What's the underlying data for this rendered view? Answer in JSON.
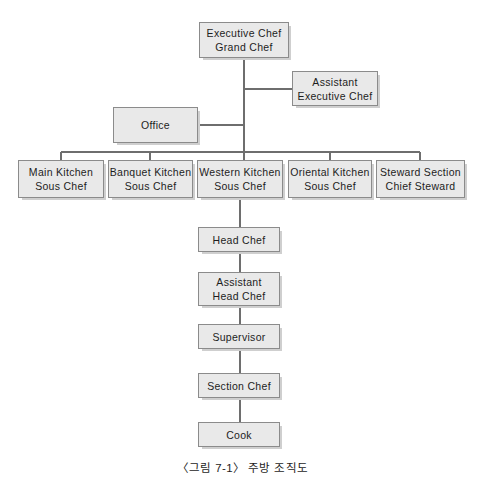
{
  "diagram": {
    "title_caption": "〈그림 7-1〉 주방 조직도",
    "colors": {
      "box_fill": "#e9e9e9",
      "box_border": "#8b8b8b",
      "box_shadow": "#cfcfcf",
      "connector": "#6e6e6e",
      "text": "#1d1d1d",
      "background": "#ffffff"
    },
    "nodes": [
      {
        "id": "executive-chef",
        "line1": "Executive Chef",
        "line2": "Grand Chef",
        "x": 199,
        "y": 22,
        "w": 90,
        "h": 36
      },
      {
        "id": "assistant-executive-chef",
        "line1": "Assistant",
        "line2": "Executive Chef",
        "x": 292,
        "y": 71,
        "w": 86,
        "h": 35
      },
      {
        "id": "office",
        "line1": "Office",
        "line2": "",
        "x": 113,
        "y": 107,
        "w": 85,
        "h": 36
      },
      {
        "id": "main-kitchen",
        "line1": "Main Kitchen",
        "line2": "Sous Chef",
        "x": 18,
        "y": 160,
        "w": 86,
        "h": 38
      },
      {
        "id": "banquet-kitchen",
        "line1": "Banquet Kitchen",
        "line2": "Sous Chef",
        "x": 108,
        "y": 160,
        "w": 85,
        "h": 38
      },
      {
        "id": "western-kitchen",
        "line1": "Western Kitchen",
        "line2": "Sous Chef",
        "x": 197,
        "y": 160,
        "w": 86,
        "h": 38
      },
      {
        "id": "oriental-kitchen",
        "line1": "Oriental Kitchen",
        "line2": "Sous Chef",
        "x": 288,
        "y": 160,
        "w": 84,
        "h": 38
      },
      {
        "id": "steward-section",
        "line1": "Steward Section",
        "line2": "Chief Steward",
        "x": 376,
        "y": 160,
        "w": 89,
        "h": 38
      },
      {
        "id": "head-chef",
        "line1": "Head Chef",
        "line2": "",
        "x": 198,
        "y": 227,
        "w": 82,
        "h": 25
      },
      {
        "id": "assistant-head-chef",
        "line1": "Assistant",
        "line2": "Head Chef",
        "x": 198,
        "y": 272,
        "w": 82,
        "h": 34
      },
      {
        "id": "supervisor",
        "line1": "Supervisor",
        "line2": "",
        "x": 198,
        "y": 324,
        "w": 82,
        "h": 25
      },
      {
        "id": "section-chef",
        "line1": "Section Chef",
        "line2": "",
        "x": 198,
        "y": 373,
        "w": 82,
        "h": 25
      },
      {
        "id": "cook",
        "line1": "Cook",
        "line2": "",
        "x": 198,
        "y": 422,
        "w": 82,
        "h": 25
      }
    ],
    "connectors": {
      "trunk_x": 244,
      "trunk_top": 58,
      "bus_y": 152,
      "bus_left": 61,
      "bus_right": 420,
      "branch_assistant_y": 89,
      "branch_office_y": 125,
      "drops": [
        61,
        150,
        244,
        330,
        420
      ],
      "spine_x": 240,
      "spine_segments": [
        [
          198,
          227
        ],
        [
          252,
          272
        ],
        [
          306,
          324
        ],
        [
          349,
          373
        ],
        [
          398,
          422
        ]
      ]
    }
  }
}
